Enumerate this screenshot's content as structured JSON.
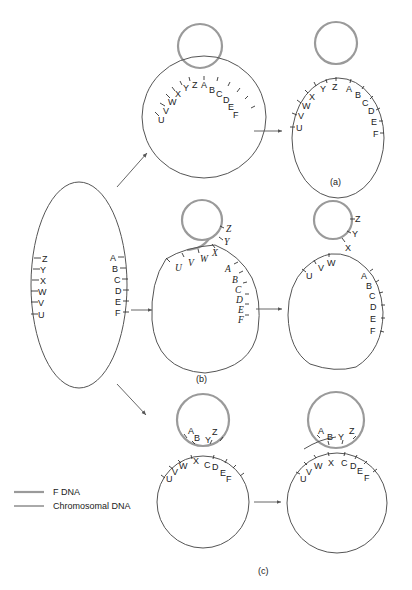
{
  "legend": {
    "f_dna": "F DNA",
    "chromosomal_dna": "Chromosomal DNA"
  },
  "colors": {
    "f_dna": "#9a9a9a",
    "chromosomal_dna": "#555555"
  },
  "panels": {
    "a": "(a)",
    "b": "(b)",
    "c": "(c)"
  },
  "markers": {
    "left_side": [
      "Z",
      "Y",
      "X",
      "W",
      "V",
      "U"
    ],
    "right_side": [
      "A",
      "B",
      "C",
      "D",
      "E",
      "F"
    ],
    "L": {
      "U": "U",
      "V": "V",
      "W": "W",
      "X": "X",
      "Y": "Y",
      "Z": "Z",
      "A": "A",
      "B": "B",
      "C": "C",
      "D": "D",
      "E": "E",
      "F": "F"
    }
  }
}
